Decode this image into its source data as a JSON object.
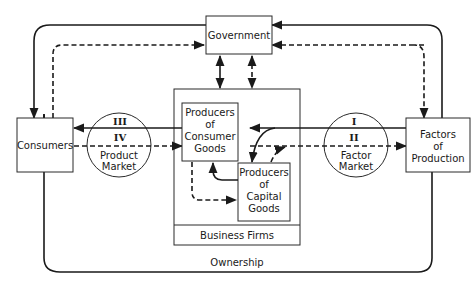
{
  "diagram": {
    "nodes": {
      "government": "Government",
      "consumers": "Consumers",
      "factors": [
        "Factors",
        "of",
        "Production"
      ],
      "consumer_goods": [
        "Producers",
        "of",
        "Consumer",
        "Goods"
      ],
      "capital_goods": [
        "Producers",
        "of",
        "Capital",
        "Goods"
      ],
      "business_firms": "Business Firms",
      "product_market": [
        "Product",
        "Market"
      ],
      "factor_market": [
        "Factor",
        "Market"
      ]
    },
    "flow_labels": {
      "product_top": "III",
      "product_bottom": "IV",
      "factor_top": "I",
      "factor_bottom": "II"
    },
    "ownership": "Ownership",
    "colors": {
      "line": "#1a1a1a",
      "background": "#ffffff"
    }
  }
}
